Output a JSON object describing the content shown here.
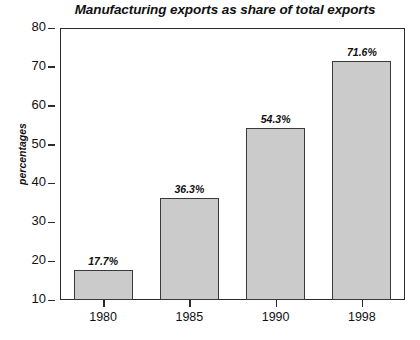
{
  "chart_data": {
    "type": "bar",
    "title": "Manufacturing exports as share of total exports",
    "xlabel": "",
    "ylabel": "percentages",
    "categories": [
      "1980",
      "1985",
      "1990",
      "1998"
    ],
    "values": [
      17.7,
      36.3,
      54.3,
      71.6
    ],
    "value_labels": [
      "17.7%",
      "36.3%",
      "54.3%",
      "71.6%"
    ],
    "ylim": [
      10,
      80
    ],
    "ytick_labels": [
      "80",
      "70",
      "60",
      "50",
      "40",
      "30",
      "20",
      "10"
    ],
    "ytick_values": [
      80,
      70,
      60,
      50,
      40,
      30,
      20,
      10
    ],
    "grid": false,
    "legend": false,
    "bar_fill_color": "#cbcbcb",
    "bar_border_color": "#3a3a3a",
    "axis_color": "#2b2b2b",
    "background_color": "#ffffff"
  }
}
